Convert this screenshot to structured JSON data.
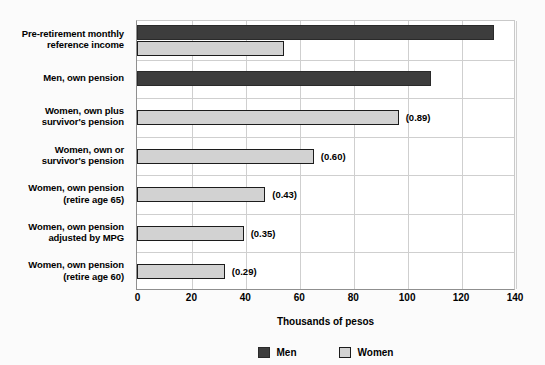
{
  "chart_data": {
    "type": "bar",
    "orientation": "horizontal",
    "title": "",
    "xlabel": "Thousands of pesos",
    "ylabel": "",
    "xlim": [
      0,
      140
    ],
    "xticks": [
      0,
      20,
      40,
      60,
      80,
      100,
      120,
      140
    ],
    "xtick_labels": [
      "0",
      "20",
      "40",
      "60",
      "80",
      "100",
      "120",
      "140"
    ],
    "grid": true,
    "legend_position": "bottom",
    "legend": [
      "Men",
      "Women"
    ],
    "colors": {
      "men": "#3d3d3d",
      "women": "#d2d2d2",
      "bar_outline": "#1c1c1c",
      "grid": "#cfcfcf",
      "axis": "#8f8f8f",
      "text": "#000000",
      "background": "#ffffff"
    },
    "categories": [
      "Pre-retirement monthly reference income",
      "Men, own pension",
      "Women, own plus survivor's pension",
      "Women, own or survivor's pension",
      "Women, own pension (retire age 65)",
      "Women, own pension adjusted by MPG",
      "Women, own pension (retire age 60)"
    ],
    "category_lines": [
      [
        "Pre-retirement monthly",
        "reference income"
      ],
      [
        "Men, own pension"
      ],
      [
        "Women, own plus",
        "survivor's pension"
      ],
      [
        "Women, own or",
        "survivor's pension"
      ],
      [
        "Women, own pension",
        "(retire age 65)"
      ],
      [
        "Women, own pension",
        "adjusted by MPG"
      ],
      [
        "Women, own pension",
        "(retire age 60)"
      ]
    ],
    "series": [
      {
        "name": "Men",
        "values": [
          132,
          108.6,
          null,
          null,
          null,
          null,
          null
        ]
      },
      {
        "name": "Women",
        "values": [
          54,
          null,
          96.5,
          65,
          47,
          39,
          32
        ]
      }
    ],
    "annotations": [
      "",
      "",
      "(0.89)",
      "(0.60)",
      "(0.43)",
      "(0.35)",
      "(0.29)"
    ],
    "bars": [
      {
        "category_index": 0,
        "series": "Men",
        "value": 132,
        "annotation": ""
      },
      {
        "category_index": 0,
        "series": "Women",
        "value": 54,
        "annotation": ""
      },
      {
        "category_index": 1,
        "series": "Men",
        "value": 108.6,
        "annotation": ""
      },
      {
        "category_index": 2,
        "series": "Women",
        "value": 96.5,
        "annotation": "(0.89)"
      },
      {
        "category_index": 3,
        "series": "Women",
        "value": 65,
        "annotation": "(0.60)"
      },
      {
        "category_index": 4,
        "series": "Women",
        "value": 47,
        "annotation": "(0.43)"
      },
      {
        "category_index": 5,
        "series": "Women",
        "value": 39,
        "annotation": "(0.35)"
      },
      {
        "category_index": 6,
        "series": "Women",
        "value": 32,
        "annotation": "(0.29)"
      }
    ]
  }
}
